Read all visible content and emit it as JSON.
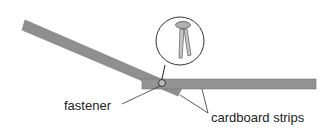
{
  "labels": {
    "fastener": "fastener",
    "strips": "cardboard strips"
  },
  "colors": {
    "strip": "#8f8f8f",
    "stroke": "#555555",
    "head": "#aaaaaa"
  }
}
